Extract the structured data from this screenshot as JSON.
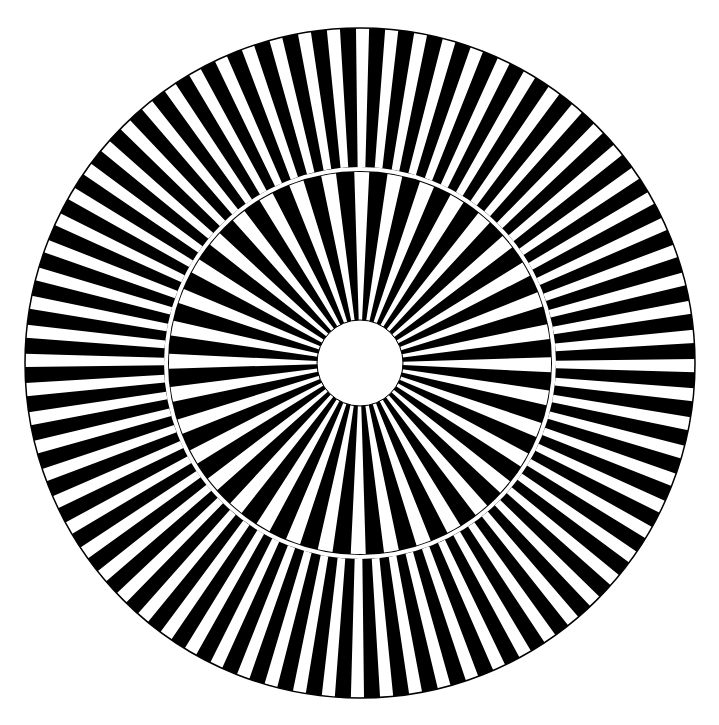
{
  "figure": {
    "type": "radial-spoke-test-pattern",
    "center": [
      360,
      363
    ],
    "colors": {
      "dark": "#000000",
      "light": "#ffffff",
      "outline": "#000000"
    },
    "outer_ring": {
      "outer_radius": 335,
      "inner_radius": 196,
      "spoke_pairs": 72,
      "white_fraction": 0.45
    },
    "separator": {
      "radius": 194,
      "width": 4
    },
    "inner_ring": {
      "outer_radius": 191,
      "inner_radius": 43,
      "spoke_pairs": 36,
      "white_fraction": 0.45
    },
    "center_hole": {
      "radius": 43
    }
  }
}
